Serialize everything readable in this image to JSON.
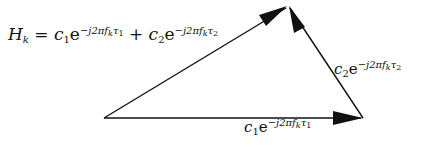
{
  "diagram": {
    "type": "vector-triangle",
    "equation": {
      "lhs": "H",
      "lhs_sub": "k",
      "equals": "=",
      "term1": {
        "coef": "c",
        "coef_sub": "1",
        "base": "e",
        "exp": "−j2πf",
        "exp_sub1": "k",
        "exp_tail": "τ",
        "exp_sub2": "1"
      },
      "plus": "+",
      "term2": {
        "coef": "c",
        "coef_sub": "2",
        "base": "e",
        "exp": "−j2πf",
        "exp_sub1": "k",
        "exp_tail": "τ",
        "exp_sub2": "2"
      }
    },
    "vectors": [
      {
        "name": "c1-vector",
        "label": {
          "coef": "c",
          "coef_sub": "1",
          "base": "e",
          "exp": "−j2πf",
          "exp_sub1": "k",
          "exp_tail": "τ",
          "exp_sub2": "1"
        }
      },
      {
        "name": "c2-vector",
        "label": {
          "coef": "c",
          "coef_sub": "2",
          "base": "e",
          "exp": "−j2πf",
          "exp_sub1": "k",
          "exp_tail": "τ",
          "exp_sub2": "2"
        }
      },
      {
        "name": "resultant-vector",
        "label": "H_k"
      }
    ],
    "stroke_color": "#111111"
  }
}
